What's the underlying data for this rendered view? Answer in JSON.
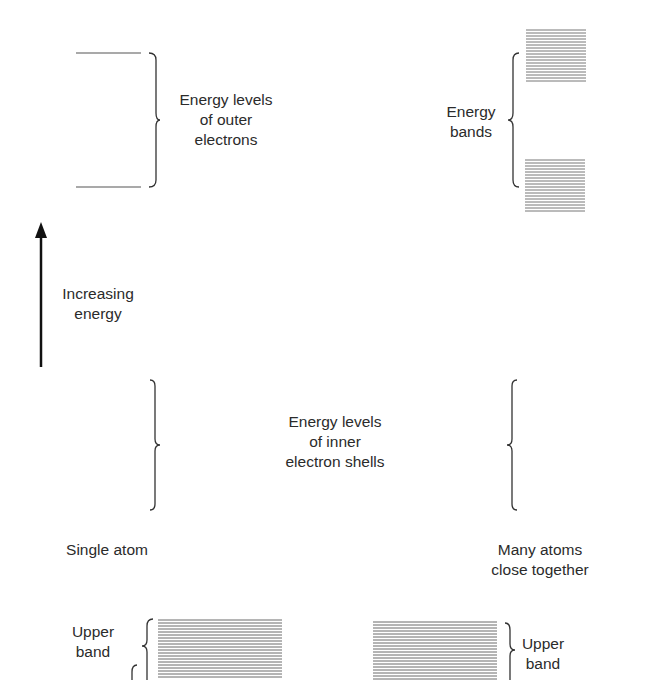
{
  "diagram": {
    "labels": {
      "outer_levels": "Energy levels\nof outer\nelectrons",
      "energy_bands": "Energy\nbands",
      "increasing_energy": "Increasing\nenergy",
      "inner_levels": "Energy levels\nof inner\nelectron shells",
      "single_atom": "Single atom",
      "many_atoms": "Many atoms\nclose together",
      "upper_band_left": "Upper\nband",
      "upper_band_right": "Upper\nband"
    },
    "colors": {
      "ink": "#2b2b2b",
      "band_line": "#6a6a6a",
      "background": "#ffffff"
    }
  }
}
